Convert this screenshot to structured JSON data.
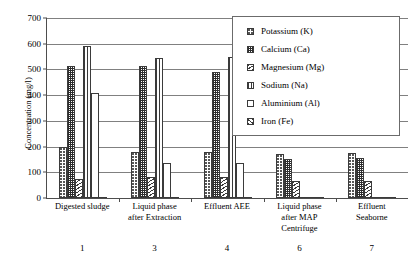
{
  "chart_data": {
    "type": "bar",
    "title": "",
    "xlabel": "",
    "ylabel": "Concentration (mg/l)",
    "ylim": [
      0,
      700
    ],
    "yticks": [
      0,
      100,
      200,
      300,
      400,
      500,
      600,
      700
    ],
    "grid": true,
    "legend_position": "top-right",
    "categories": [
      "Digested sludge",
      "Liquid phase after Extraction",
      "Effluent AEE",
      "Liquid phase after MAP Centrifuge",
      "Effluent Seaborne"
    ],
    "category_lines": [
      [
        "Digested sludge"
      ],
      [
        "Liquid phase",
        "after Extraction"
      ],
      [
        "Effluent AEE"
      ],
      [
        "Liquid phase",
        "after MAP",
        "Centrifuge"
      ],
      [
        "Effluent",
        "Seaborne"
      ]
    ],
    "category_numbers": [
      "1",
      "3",
      "4",
      "6",
      "7"
    ],
    "series": [
      {
        "name": "Potassium (K)",
        "key": "s-k",
        "values": [
          200,
          180,
          180,
          170,
          175
        ]
      },
      {
        "name": "Calcium (Ca)",
        "key": "s-ca",
        "values": [
          515,
          515,
          490,
          150,
          155
        ]
      },
      {
        "name": "Magnesium (Mg)",
        "key": "s-mg",
        "values": [
          75,
          80,
          80,
          65,
          65
        ]
      },
      {
        "name": "Sodium (Na)",
        "key": "s-na",
        "values": [
          590,
          545,
          550,
          0,
          0
        ]
      },
      {
        "name": "Aluminium (Al)",
        "key": "s-al",
        "values": [
          410,
          135,
          135,
          0,
          0
        ]
      },
      {
        "name": "Iron (Fe)",
        "key": "s-fe",
        "values": [
          0,
          0,
          0,
          0,
          0
        ]
      }
    ]
  }
}
